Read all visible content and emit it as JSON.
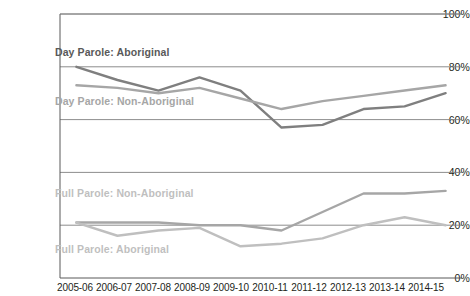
{
  "chart_data": {
    "type": "line",
    "title": "",
    "xlabel": "",
    "ylabel": "",
    "ylim": [
      0,
      100
    ],
    "yticks": [
      "0%",
      "20%",
      "40%",
      "60%",
      "80%",
      "100%"
    ],
    "ytick_values": [
      0,
      20,
      40,
      60,
      80,
      100
    ],
    "grid": "horizontal",
    "legend_position": "inline-annotations",
    "categories": [
      "2005-06",
      "2006-07",
      "2007-08",
      "2008-09",
      "2009-10",
      "2010-11",
      "2011-12",
      "2012-13",
      "2013-14",
      "2014-15"
    ],
    "series": [
      {
        "name": "Day Parole: Aboriginal",
        "color": "#7f7f7f",
        "values": [
          80,
          75,
          71,
          76,
          71,
          57,
          58,
          64,
          65,
          70
        ]
      },
      {
        "name": "Day Parole: Non-Aboriginal",
        "color": "#a6a6a6",
        "values": [
          73,
          72,
          70,
          72,
          68,
          64,
          67,
          69,
          71,
          73
        ]
      },
      {
        "name": "Full Parole: Non-Aboriginal",
        "color": "#a6a6a6",
        "values": [
          21,
          21,
          21,
          20,
          20,
          18,
          25,
          32,
          32,
          33
        ]
      },
      {
        "name": "Full Parole: Aboriginal",
        "color": "#bfbfbf",
        "values": [
          21,
          16,
          18,
          19,
          12,
          13,
          15,
          20,
          23,
          20
        ]
      }
    ],
    "annotations": [
      {
        "text": "Day Parole: Aboriginal",
        "x_pct": 11.7,
        "y_pct": 15.5
      },
      {
        "text": "Day Parole: Non-Aboriginal",
        "x_pct": 11.7,
        "y_pct": 32.1
      },
      {
        "text": "Full Parole: Non-Aboriginal",
        "x_pct": 11.7,
        "y_pct": 63.2
      },
      {
        "text": "Full Parole: Aboriginal",
        "x_pct": 11.7,
        "y_pct": 82.3
      }
    ]
  },
  "axis_colors": {
    "gridline": "#808080",
    "axis": "#595959",
    "tick_text": "#231f20"
  }
}
